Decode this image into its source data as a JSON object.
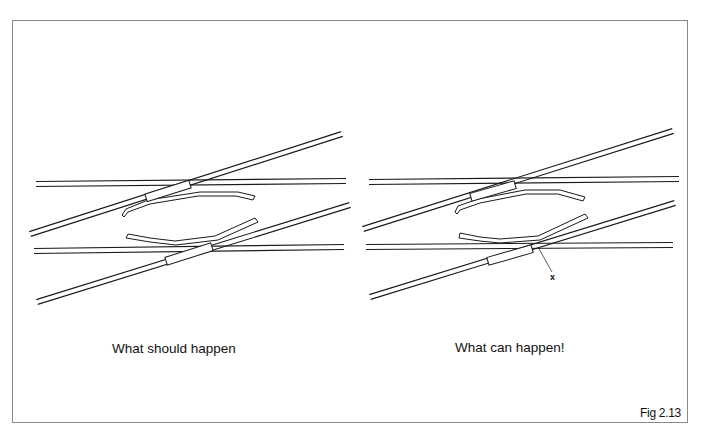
{
  "figure": {
    "label": "Fig 2.13",
    "stroke_color": "#1a1a1a",
    "frame_color": "#8a8a8a",
    "background": "#ffffff"
  },
  "panels": [
    {
      "id": "left",
      "caption": "What should happen",
      "rails": [
        {
          "name": "straight-track-upper",
          "x1": 36,
          "y1": 184,
          "x2": 346,
          "y2": 181,
          "gap": 5
        },
        {
          "name": "diagonal-track-upper",
          "x1": 30,
          "y1": 234,
          "x2": 342,
          "y2": 134,
          "gap": 5
        },
        {
          "name": "straight-track-lower",
          "x1": 34,
          "y1": 251,
          "x2": 344,
          "y2": 247,
          "gap": 5
        },
        {
          "name": "diagonal-track-lower",
          "x1": 37,
          "y1": 302,
          "x2": 350,
          "y2": 205,
          "gap": 5
        }
      ],
      "sliders": [
        {
          "name": "sliding-block-upper",
          "cx": 168,
          "cy": 191,
          "w": 46,
          "h": 8,
          "angle": -17.5
        },
        {
          "name": "sliding-block-lower",
          "cx": 189,
          "cy": 254,
          "w": 48,
          "h": 8,
          "angle": -17.5
        }
      ],
      "switch_rails": [
        {
          "name": "moving-rail-upper",
          "points": "122,215 126,209 148,200 200,192 238,192 255,196 253,200 236,196 198,196 150,204 128,212 124,217"
        },
        {
          "name": "moving-rail-lower",
          "points": "126,238 128,234 150,238 175,241 215,236 255,218 258,222 218,240 176,245 150,242"
        }
      ]
    },
    {
      "id": "right",
      "caption": "What can happen!",
      "pointer_label": "x",
      "pointer": {
        "x1": 538,
        "y1": 247,
        "x2": 552,
        "y2": 272
      },
      "rails": [
        {
          "name": "straight-track-upper",
          "x1": 369,
          "y1": 182,
          "x2": 679,
          "y2": 179,
          "gap": 5
        },
        {
          "name": "diagonal-track-upper",
          "x1": 363,
          "y1": 229,
          "x2": 673,
          "y2": 131,
          "gap": 5
        },
        {
          "name": "straight-track-lower",
          "x1": 366,
          "y1": 247,
          "x2": 673,
          "y2": 245,
          "gap": 5
        },
        {
          "name": "diagonal-track-lower",
          "x1": 370,
          "y1": 297,
          "x2": 675,
          "y2": 203,
          "gap": 5
        }
      ],
      "sliders": [
        {
          "name": "sliding-block-upper",
          "cx": 493,
          "cy": 191,
          "w": 46,
          "h": 8,
          "angle": -16
        },
        {
          "name": "sliding-block-lower",
          "cx": 510,
          "cy": 255,
          "w": 46,
          "h": 8,
          "angle": -16
        }
      ],
      "switch_rails": [
        {
          "name": "moving-rail-upper",
          "points": "455,212 458,206 478,199 525,190 560,190 585,197 583,201 558,194 526,194 480,203 460,210 457,214"
        },
        {
          "name": "moving-rail-lower",
          "points": "459,238 460,233 480,237 500,239 538,236 585,214 588,218 540,240 500,243 480,241"
        }
      ]
    }
  ]
}
